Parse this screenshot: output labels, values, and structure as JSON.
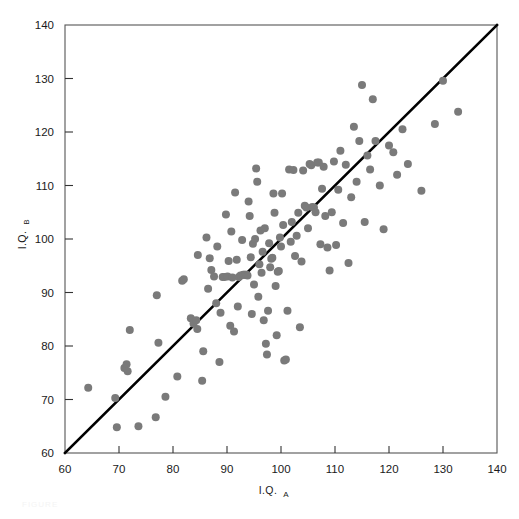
{
  "figure": {
    "background_color": "#ffffff",
    "width": 519,
    "height": 519,
    "caption_faint": "FIGURE"
  },
  "axes": {
    "x_title_main": "I.Q.",
    "x_title_sub": "A",
    "y_title_main": "I.Q.",
    "y_title_sub": "B",
    "x_ticks": [
      "60",
      "70",
      "80",
      "90",
      "100",
      "110",
      "120",
      "130",
      "140"
    ],
    "y_ticks": [
      "60",
      "70",
      "80",
      "90",
      "100",
      "110",
      "120",
      "130",
      "140"
    ],
    "frame_color": "#555555",
    "tick_color": "#333333"
  },
  "chart_data": {
    "type": "scatter",
    "title": "",
    "xlabel": "I.Q._A",
    "ylabel": "I.Q._B",
    "xlim": [
      60,
      140
    ],
    "ylim": [
      60,
      140
    ],
    "xticks": [
      60,
      70,
      80,
      90,
      100,
      110,
      120,
      130,
      140
    ],
    "yticks": [
      60,
      70,
      80,
      90,
      100,
      110,
      120,
      130,
      140
    ],
    "grid": false,
    "legend": null,
    "marker_color": "#7a7a7a",
    "marker_size_px": 8,
    "reference_line": {
      "name": "identity-line",
      "equation": "y = x",
      "from": [
        60,
        60
      ],
      "to": [
        140,
        140
      ],
      "color": "#000000",
      "width_px": 2.6
    },
    "n_points": 142,
    "points": [
      [
        64.3,
        72.2
      ],
      [
        69.3,
        70.3
      ],
      [
        69.6,
        64.8
      ],
      [
        71.0,
        75.9
      ],
      [
        71.4,
        76.6
      ],
      [
        71.6,
        75.3
      ],
      [
        72.0,
        83.0
      ],
      [
        73.6,
        65.0
      ],
      [
        76.8,
        66.7
      ],
      [
        77.0,
        89.5
      ],
      [
        77.3,
        80.6
      ],
      [
        78.6,
        70.5
      ],
      [
        80.8,
        74.3
      ],
      [
        81.7,
        92.2
      ],
      [
        82.0,
        92.5
      ],
      [
        83.3,
        85.2
      ],
      [
        83.8,
        84.2
      ],
      [
        84.3,
        84.8
      ],
      [
        84.5,
        83.2
      ],
      [
        84.6,
        97.0
      ],
      [
        85.4,
        73.5
      ],
      [
        85.6,
        79.0
      ],
      [
        86.2,
        100.3
      ],
      [
        86.5,
        90.7
      ],
      [
        86.8,
        96.4
      ],
      [
        87.1,
        94.2
      ],
      [
        87.6,
        93.0
      ],
      [
        88.0,
        88.0
      ],
      [
        88.2,
        98.6
      ],
      [
        88.6,
        77.0
      ],
      [
        88.8,
        86.2
      ],
      [
        89.2,
        92.9
      ],
      [
        89.5,
        92.9
      ],
      [
        89.8,
        104.6
      ],
      [
        90.1,
        93.0
      ],
      [
        90.3,
        95.9
      ],
      [
        90.6,
        83.8
      ],
      [
        90.8,
        101.4
      ],
      [
        91.0,
        92.8
      ],
      [
        91.3,
        82.7
      ],
      [
        91.5,
        108.7
      ],
      [
        91.8,
        96.1
      ],
      [
        92.0,
        87.4
      ],
      [
        92.2,
        92.9
      ],
      [
        92.5,
        93.2
      ],
      [
        92.8,
        99.8
      ],
      [
        93.0,
        93.3
      ],
      [
        93.2,
        93.3
      ],
      [
        93.4,
        93.3
      ],
      [
        93.6,
        93.3
      ],
      [
        93.8,
        93.2
      ],
      [
        94.0,
        107.0
      ],
      [
        94.2,
        104.3
      ],
      [
        94.4,
        96.6
      ],
      [
        94.6,
        86.0
      ],
      [
        94.8,
        99.1
      ],
      [
        95.0,
        91.5
      ],
      [
        95.2,
        100.0
      ],
      [
        95.4,
        113.2
      ],
      [
        95.6,
        110.7
      ],
      [
        95.8,
        89.2
      ],
      [
        96.0,
        95.3
      ],
      [
        96.2,
        101.6
      ],
      [
        96.4,
        93.7
      ],
      [
        96.6,
        97.6
      ],
      [
        96.8,
        84.8
      ],
      [
        97.0,
        102.0
      ],
      [
        97.2,
        80.4
      ],
      [
        97.4,
        78.4
      ],
      [
        97.6,
        86.6
      ],
      [
        97.8,
        99.2
      ],
      [
        98.0,
        94.7
      ],
      [
        98.2,
        96.3
      ],
      [
        98.4,
        96.5
      ],
      [
        98.6,
        108.5
      ],
      [
        98.8,
        104.9
      ],
      [
        99.0,
        91.2
      ],
      [
        99.2,
        82.0
      ],
      [
        99.4,
        93.9
      ],
      [
        99.6,
        94.0
      ],
      [
        99.8,
        100.3
      ],
      [
        100.0,
        98.6
      ],
      [
        100.2,
        108.5
      ],
      [
        100.4,
        102.6
      ],
      [
        100.6,
        77.3
      ],
      [
        100.9,
        77.5
      ],
      [
        101.2,
        86.6
      ],
      [
        101.5,
        113.0
      ],
      [
        101.8,
        99.5
      ],
      [
        102.0,
        103.2
      ],
      [
        102.3,
        112.9
      ],
      [
        102.6,
        96.8
      ],
      [
        102.9,
        100.6
      ],
      [
        103.2,
        104.9
      ],
      [
        103.5,
        83.5
      ],
      [
        103.8,
        95.8
      ],
      [
        104.1,
        112.8
      ],
      [
        104.4,
        106.2
      ],
      [
        104.7,
        105.9
      ],
      [
        105.0,
        102.0
      ],
      [
        105.3,
        114.0
      ],
      [
        105.6,
        113.8
      ],
      [
        105.8,
        106.0
      ],
      [
        106.1,
        105.9
      ],
      [
        106.4,
        105.0
      ],
      [
        106.7,
        114.3
      ],
      [
        107.0,
        114.3
      ],
      [
        107.3,
        99.0
      ],
      [
        107.6,
        109.4
      ],
      [
        107.9,
        113.5
      ],
      [
        108.2,
        104.3
      ],
      [
        108.6,
        98.4
      ],
      [
        109.0,
        94.1
      ],
      [
        109.4,
        105.0
      ],
      [
        109.8,
        114.5
      ],
      [
        110.2,
        98.9
      ],
      [
        110.6,
        109.2
      ],
      [
        111.0,
        116.5
      ],
      [
        111.5,
        103.0
      ],
      [
        112.0,
        113.9
      ],
      [
        112.5,
        95.5
      ],
      [
        113.0,
        107.8
      ],
      [
        113.5,
        121.0
      ],
      [
        114.0,
        110.7
      ],
      [
        114.5,
        118.3
      ],
      [
        115.0,
        128.8
      ],
      [
        115.5,
        103.2
      ],
      [
        116.0,
        115.6
      ],
      [
        116.5,
        113.0
      ],
      [
        117.0,
        126.1
      ],
      [
        117.5,
        118.3
      ],
      [
        118.3,
        110.0
      ],
      [
        119.0,
        101.8
      ],
      [
        120.0,
        117.5
      ],
      [
        120.8,
        116.2
      ],
      [
        121.5,
        112.0
      ],
      [
        122.5,
        120.5
      ],
      [
        123.5,
        114.0
      ],
      [
        126.0,
        109.0
      ],
      [
        128.5,
        121.5
      ],
      [
        130.0,
        129.6
      ],
      [
        132.8,
        123.8
      ]
    ]
  }
}
